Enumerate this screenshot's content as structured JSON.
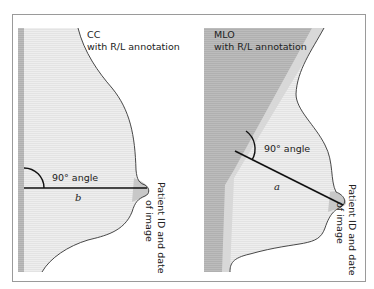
{
  "figure": {
    "frame_color": "#9a9a9a",
    "background": "#ffffff",
    "colors": {
      "tissue_fill": "#ececec",
      "pectoral_dark": "#b9b9b9",
      "pectoral_light": "#dcdcdc",
      "chest_wall_strip": "#b5b5b5",
      "nipple_fill": "#c8c8c8",
      "outline": "#333333",
      "measure_line": "#111111"
    }
  },
  "panels": [
    {
      "id": "cc",
      "title": "CC",
      "subtitle": "with R/L annotation",
      "angle_label": "90° angle",
      "distance_label": "b",
      "side_label_line1": "Patient ID and date",
      "side_label_line2": "of image"
    },
    {
      "id": "mlo",
      "title": "MLO",
      "subtitle": "with R/L annotation",
      "angle_label": "90° angle",
      "distance_label": "a",
      "side_label_line1": "Patient ID and date",
      "side_label_line2": "of image"
    }
  ]
}
